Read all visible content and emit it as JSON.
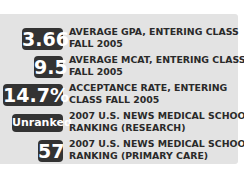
{
  "stats": [
    {
      "value": "3.66",
      "label_line1": "AVERAGE GPA, ENTERING CLASS",
      "label_line2": "FALL 2005"
    },
    {
      "value": "9.5",
      "label_line1": "AVERAGE MCAT, ENTERING CLASS",
      "label_line2": "FALL 2005"
    },
    {
      "value": "14.7%",
      "label_line1": "ACCEPTANCE RATE, ENTERING",
      "label_line2": "CLASS FALL 2005"
    },
    {
      "value": "Unranked",
      "label_line1": "2007 U.S. NEWS MEDICAL SCHOOL",
      "label_line2": "RANKING (RESEARCH)"
    },
    {
      "value": "57",
      "label_line1": "2007 U.S. NEWS MEDICAL SCHOOL",
      "label_line2": "RANKING (PRIMARY CARE)"
    }
  ],
  "colors": {
    "panel": "#e3e3e3",
    "badge": "#333333",
    "badge_text": "#ffffff",
    "label_text": "#2a2a2a"
  }
}
